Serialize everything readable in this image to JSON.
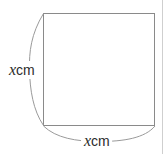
{
  "figure": {
    "kind": "geometry-diagram",
    "canvas": {
      "width": 165,
      "height": 154,
      "background_color": "#ffffff",
      "border_color": "#c8c8c8"
    },
    "shape": {
      "name": "square",
      "stroke_color": "#8a8a8a",
      "fill_color": "#ffffff",
      "stroke_width": 1,
      "left": 43,
      "top": 13,
      "right": 155,
      "bottom": 126,
      "width": 112,
      "height": 113
    },
    "braces": [
      {
        "name": "left-dimension-brace",
        "orientation": "vertical",
        "stroke_color": "#9a9a9a",
        "from": [
          43,
          13
        ],
        "to": [
          43,
          126
        ],
        "apex": [
          29,
          70
        ]
      },
      {
        "name": "bottom-dimension-brace",
        "orientation": "horizontal",
        "stroke_color": "#9a9a9a",
        "from": [
          43,
          126
        ],
        "to": [
          155,
          126
        ],
        "apex": [
          99,
          141
        ]
      }
    ],
    "labels": {
      "left": {
        "variable": "x",
        "unit": "cm",
        "text": "xcm",
        "x": 7,
        "y": 61,
        "color": "#2b2b2b"
      },
      "bottom": {
        "variable": "x",
        "unit": "cm",
        "text": "xcm",
        "x": 81,
        "y": 132,
        "color": "#2b2b2b"
      }
    }
  }
}
